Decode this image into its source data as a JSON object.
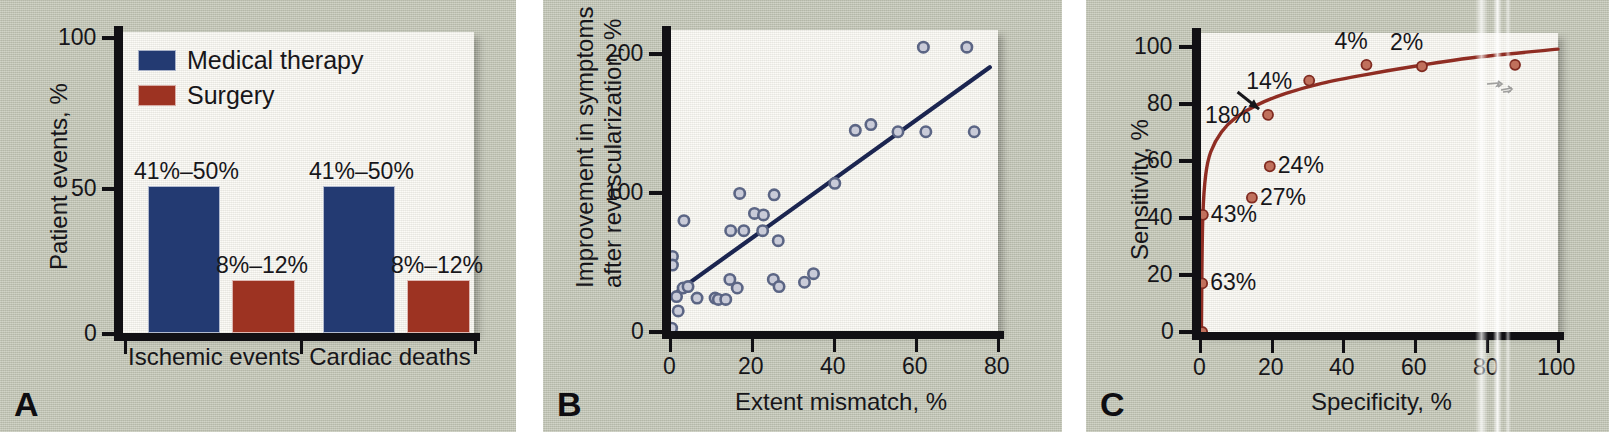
{
  "figure": {
    "background_color": "#c4c7b7",
    "plot_background": "#fbfaf4",
    "axis_color": "#111014"
  },
  "panels": [
    {
      "letter": "A",
      "chart_data": {
        "type": "bar",
        "title": "",
        "xlabel": "",
        "ylabel": "Patient events, %",
        "ylim": [
          0,
          100
        ],
        "yticks": [
          0,
          50,
          100
        ],
        "ytick_labels": [
          "0",
          "50",
          "100"
        ],
        "grid": false,
        "legend_position": "top-left",
        "categories": [
          "Ischemic events",
          "Cardiac deaths"
        ],
        "series": [
          {
            "name": "Medical therapy",
            "color": "#233a72",
            "values": [
              50,
              50
            ],
            "data_labels": [
              "41%–50%",
              "41%–50%"
            ]
          },
          {
            "name": "Surgery",
            "color": "#9d3322",
            "values": [
              18,
              18
            ],
            "data_labels": [
              "8%–12%",
              "8%–12%"
            ]
          }
        ]
      }
    },
    {
      "letter": "B",
      "chart_data": {
        "type": "scatter",
        "title": "",
        "xlabel": "Extent mismatch, %",
        "ylabel": "Improvement in symptoms\nafter revascularization, %",
        "ylabel_line1": "Improvement in symptoms",
        "ylabel_line2": "after revascularization, %",
        "xlim": [
          0,
          80
        ],
        "ylim": [
          0,
          210
        ],
        "xticks": [
          0,
          20,
          40,
          60,
          80
        ],
        "xtick_labels": [
          "0",
          "20",
          "40",
          "60",
          "80"
        ],
        "yticks": [
          0,
          100,
          200
        ],
        "ytick_labels": [
          "0",
          "100",
          "200"
        ],
        "grid": false,
        "marker_color": "#5b6584",
        "marker_style": "open-circle",
        "trendline": {
          "color": "#1b2550",
          "x": [
            2,
            78
          ],
          "y": [
            28,
            184
          ]
        },
        "points": [
          {
            "x": 0.4,
            "y": 2
          },
          {
            "x": 0.6,
            "y": 52
          },
          {
            "x": 0.6,
            "y": 46
          },
          {
            "x": 1.6,
            "y": 24
          },
          {
            "x": 2.0,
            "y": 14
          },
          {
            "x": 3.4,
            "y": 77
          },
          {
            "x": 3.2,
            "y": 30
          },
          {
            "x": 4.4,
            "y": 31
          },
          {
            "x": 6.6,
            "y": 23
          },
          {
            "x": 11.0,
            "y": 23
          },
          {
            "x": 11.8,
            "y": 22
          },
          {
            "x": 13.6,
            "y": 22
          },
          {
            "x": 14.6,
            "y": 36
          },
          {
            "x": 14.8,
            "y": 70
          },
          {
            "x": 16.4,
            "y": 30
          },
          {
            "x": 17.0,
            "y": 96
          },
          {
            "x": 18.0,
            "y": 70
          },
          {
            "x": 20.6,
            "y": 82
          },
          {
            "x": 22.8,
            "y": 81
          },
          {
            "x": 22.6,
            "y": 70
          },
          {
            "x": 25.4,
            "y": 95
          },
          {
            "x": 25.2,
            "y": 36
          },
          {
            "x": 26.4,
            "y": 63
          },
          {
            "x": 26.6,
            "y": 31
          },
          {
            "x": 32.8,
            "y": 34
          },
          {
            "x": 35.0,
            "y": 40
          },
          {
            "x": 40.2,
            "y": 103
          },
          {
            "x": 45.2,
            "y": 140
          },
          {
            "x": 49.0,
            "y": 144
          },
          {
            "x": 55.6,
            "y": 139
          },
          {
            "x": 61.8,
            "y": 198
          },
          {
            "x": 62.4,
            "y": 139
          },
          {
            "x": 72.4,
            "y": 198
          },
          {
            "x": 74.2,
            "y": 139
          }
        ]
      }
    },
    {
      "letter": "C",
      "chart_data": {
        "type": "line",
        "title": "",
        "xlabel": "Specificity, %",
        "ylabel": "Sensitivity, %",
        "xlim": [
          0,
          100
        ],
        "ylim": [
          0,
          105
        ],
        "xticks": [
          0,
          20,
          40,
          60,
          80,
          100
        ],
        "xtick_labels": [
          "0",
          "20",
          "40",
          "60",
          "80",
          "100"
        ],
        "yticks": [
          0,
          20,
          40,
          60,
          80,
          100
        ],
        "ytick_labels": [
          "0",
          "20",
          "40",
          "60",
          "80",
          "100"
        ],
        "grid": false,
        "curve_color": "#8f2d23",
        "marker_color": "#c0705c",
        "curve": [
          {
            "x": 0.4,
            "y": 0
          },
          {
            "x": 0.5,
            "y": 17
          },
          {
            "x": 0.8,
            "y": 41
          },
          {
            "x": 1.6,
            "y": 55
          },
          {
            "x": 3.0,
            "y": 63
          },
          {
            "x": 6.0,
            "y": 70
          },
          {
            "x": 10.0,
            "y": 75
          },
          {
            "x": 16.0,
            "y": 79.5
          },
          {
            "x": 24.0,
            "y": 83.5
          },
          {
            "x": 34.0,
            "y": 87
          },
          {
            "x": 46.0,
            "y": 90
          },
          {
            "x": 60.0,
            "y": 93
          },
          {
            "x": 76.0,
            "y": 96
          },
          {
            "x": 100.0,
            "y": 99
          }
        ],
        "points": [
          {
            "x": 0.6,
            "y": 0,
            "label": "",
            "label_pos": "none"
          },
          {
            "x": 0.6,
            "y": 17,
            "label": "63%",
            "label_pos": "right"
          },
          {
            "x": 0.8,
            "y": 41,
            "label": "43%",
            "label_pos": "right"
          },
          {
            "x": 14.5,
            "y": 47,
            "label": "27%",
            "label_pos": "right"
          },
          {
            "x": 19.5,
            "y": 58,
            "label": "24%",
            "label_pos": "right"
          },
          {
            "x": 19.0,
            "y": 76,
            "label": "18%",
            "label_pos": "left"
          },
          {
            "x": 30.5,
            "y": 88,
            "label": "14%",
            "label_pos": "left"
          },
          {
            "x": 46.5,
            "y": 93.5,
            "label": "4%",
            "label_pos": "above-left"
          },
          {
            "x": 62.0,
            "y": 93,
            "label": "2%",
            "label_pos": "above-left"
          },
          {
            "x": 88.0,
            "y": 93.5,
            "label": "",
            "label_pos": "none"
          }
        ],
        "annotations": [
          {
            "type": "arrow",
            "label": "18%-pointer",
            "from": {
              "x": 10.5,
              "y": 84
            },
            "to": {
              "x": 16.5,
              "y": 78
            }
          }
        ],
        "artifact": "vertical-scan-streak"
      }
    }
  ]
}
